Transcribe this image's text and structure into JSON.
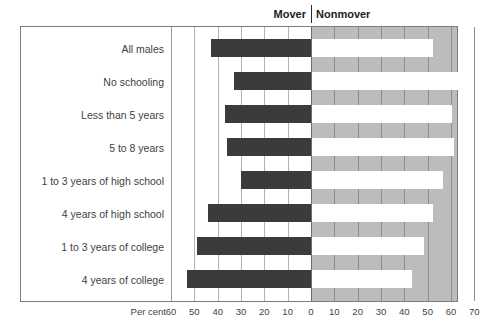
{
  "header": {
    "mover_label": "Mover",
    "nonmover_label": "Nonmover"
  },
  "axis": {
    "unit_label": "Per cent",
    "tick_labels": [
      "60",
      "50",
      "40",
      "30",
      "20",
      "10",
      "0",
      "10",
      "20",
      "30",
      "40",
      "50",
      "60",
      "70"
    ]
  },
  "colors": {
    "mover_bar": "#3b3b3b",
    "nonmover_bar": "#ffffff",
    "nonmover_background": "#bcbcbc",
    "mover_background": "#ffffff",
    "frame": "#7d7d7d",
    "gridline_left": "#b3b3b3",
    "gridline_right": "#8c8c8c",
    "text": "#3f3f3f"
  },
  "chart_data": {
    "type": "bar",
    "title": "",
    "subtitle": "",
    "orientation": "horizontal",
    "layout": "diverging-bidirectional",
    "xlabel": "Per cent",
    "ylabel": "",
    "grid": true,
    "legend_position": "top",
    "xlim": [
      -60,
      70
    ],
    "xticks": [
      -60,
      -50,
      -40,
      -30,
      -20,
      -10,
      0,
      10,
      20,
      30,
      40,
      50,
      60,
      70
    ],
    "xticklabels": [
      "60",
      "50",
      "40",
      "30",
      "20",
      "10",
      "0",
      "10",
      "20",
      "30",
      "40",
      "50",
      "60",
      "70"
    ],
    "categories": [
      "All males",
      "No schooling",
      "Less than 5 years",
      "5 to 8 years",
      "1 to 3 years of high school",
      "4 years of high school",
      "1 to 3 years of college",
      "4 years of college"
    ],
    "series": [
      {
        "name": "Mover",
        "direction": "left",
        "values": [
          43,
          33,
          37,
          36,
          30,
          44,
          49,
          53
        ]
      },
      {
        "name": "Nonmover",
        "direction": "right",
        "values": [
          52,
          65,
          60,
          61,
          56,
          52,
          48,
          43
        ]
      }
    ]
  }
}
